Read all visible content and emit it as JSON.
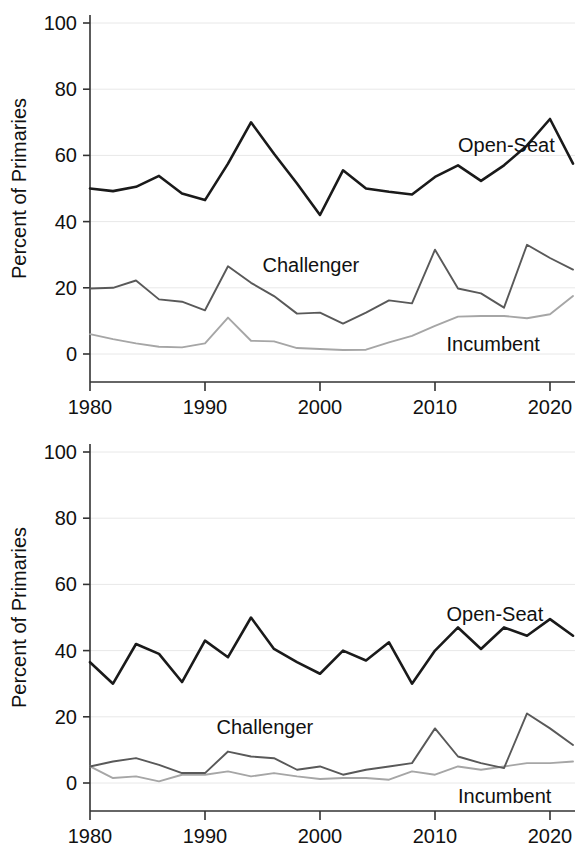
{
  "figure": {
    "width": 581,
    "height": 858,
    "background": "#ffffff",
    "panel_count": 2
  },
  "axis": {
    "y_title": "Percent of Primaries",
    "y_ticks": [
      "0",
      "20",
      "40",
      "60",
      "80",
      "100"
    ],
    "x_ticks": [
      "1980",
      "1990",
      "2000",
      "2010",
      "2020"
    ]
  },
  "colors": {
    "open_seat": "#1a1a1a",
    "challenger": "#595959",
    "incumbent": "#a6a6a6",
    "gridline": "#e8e8e8",
    "axis": "#333333",
    "text": "#111111"
  },
  "chart_data": [
    {
      "type": "line",
      "panel": "top",
      "title": "",
      "xlabel": "",
      "ylabel": "Percent of Primaries",
      "xlim": [
        1980,
        2022
      ],
      "ylim": [
        0,
        100
      ],
      "grid": true,
      "legend_position": "inline-annotations",
      "x": [
        1980,
        1982,
        1984,
        1986,
        1988,
        1990,
        1992,
        1994,
        1996,
        1998,
        2000,
        2002,
        2004,
        2006,
        2008,
        2010,
        2012,
        2014,
        2016,
        2018,
        2020,
        2022
      ],
      "series": [
        {
          "name": "Open-Seat",
          "color": "#1a1a1a",
          "label_x": 2012,
          "label_y": 63,
          "values": [
            50.0,
            49.2,
            50.5,
            53.8,
            48.5,
            46.5,
            57.5,
            70.0,
            60.5,
            51.5,
            42.0,
            55.5,
            50.0,
            49.0,
            48.2,
            53.5,
            57.0,
            52.3,
            57.0,
            63.0,
            71.0,
            57.5
          ]
        },
        {
          "name": "Challenger",
          "color": "#595959",
          "label_x": 1995,
          "label_y": 27,
          "values": [
            19.8,
            20.0,
            22.2,
            16.5,
            15.8,
            13.2,
            26.5,
            21.5,
            17.5,
            12.2,
            12.5,
            9.2,
            12.5,
            16.2,
            15.3,
            31.5,
            19.8,
            18.3,
            14.0,
            33.0,
            29.0,
            25.5
          ]
        },
        {
          "name": "Incumbent",
          "color": "#a6a6a6",
          "label_x": 2011,
          "label_y": 3,
          "values": [
            6.0,
            4.5,
            3.2,
            2.2,
            2.0,
            3.2,
            11.0,
            4.0,
            3.8,
            1.8,
            1.5,
            1.2,
            1.3,
            3.5,
            5.5,
            8.5,
            11.3,
            11.5,
            11.5,
            10.8,
            12.0,
            17.5
          ]
        }
      ]
    },
    {
      "type": "line",
      "panel": "bottom",
      "title": "",
      "xlabel": "",
      "ylabel": "Percent of Primaries",
      "xlim": [
        1980,
        2022
      ],
      "ylim": [
        0,
        100
      ],
      "grid": true,
      "legend_position": "inline-annotations",
      "x": [
        1980,
        1982,
        1984,
        1986,
        1988,
        1990,
        1992,
        1994,
        1996,
        1998,
        2000,
        2002,
        2004,
        2006,
        2008,
        2010,
        2012,
        2014,
        2016,
        2018,
        2020,
        2022
      ],
      "series": [
        {
          "name": "Open-Seat",
          "color": "#1a1a1a",
          "label_x": 2011,
          "label_y": 51,
          "values": [
            36.5,
            30.0,
            42.0,
            39.0,
            30.5,
            43.0,
            38.0,
            50.0,
            40.5,
            36.5,
            33.0,
            40.0,
            37.0,
            42.5,
            30.0,
            40.0,
            47.0,
            40.5,
            47.0,
            44.5,
            49.5,
            44.5
          ]
        },
        {
          "name": "Challenger",
          "color": "#595959",
          "label_x": 1991,
          "label_y": 17,
          "values": [
            5.0,
            6.5,
            7.5,
            5.5,
            3.0,
            3.0,
            9.5,
            8.0,
            7.5,
            4.0,
            5.0,
            2.5,
            4.0,
            5.0,
            6.0,
            16.5,
            8.0,
            6.0,
            4.5,
            21.0,
            16.5,
            11.5
          ]
        },
        {
          "name": "Incumbent",
          "color": "#a6a6a6",
          "label_x": 2012,
          "label_y": -4,
          "values": [
            5.0,
            1.5,
            2.0,
            0.5,
            2.5,
            2.5,
            3.5,
            2.0,
            3.0,
            2.0,
            1.2,
            1.5,
            1.5,
            1.0,
            3.5,
            2.5,
            5.0,
            4.0,
            5.0,
            6.0,
            6.0,
            6.5
          ]
        }
      ]
    }
  ]
}
